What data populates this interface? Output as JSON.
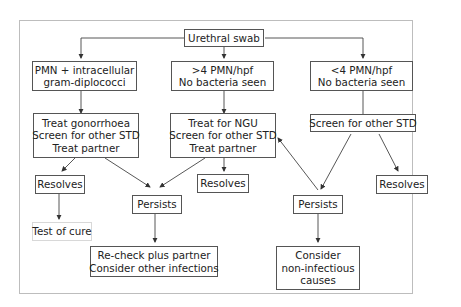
{
  "diagram": {
    "type": "flowchart",
    "nodes": {
      "root": {
        "lines": [
          "Urethral swab"
        ]
      },
      "left_finding": {
        "lines": [
          "PMN + intracellular",
          "gram-diplococci"
        ]
      },
      "mid_finding": {
        "lines": [
          ">4 PMN/hpf",
          "No bacteria seen"
        ]
      },
      "right_finding": {
        "lines": [
          "<4 PMN/hpf",
          "No bacteria seen"
        ]
      },
      "left_treat": {
        "lines": [
          "Treat gonorrhoea",
          "Screen for other STD",
          "Treat partner"
        ]
      },
      "mid_treat": {
        "lines": [
          "Treat for NGU",
          "Screen for other STD",
          "Treat partner"
        ]
      },
      "right_treat": {
        "lines": [
          "Screen for other STD"
        ]
      },
      "left_resolves": {
        "lines": [
          "Resolves"
        ]
      },
      "mid_resolves": {
        "lines": [
          "Resolves"
        ]
      },
      "right_resolves": {
        "lines": [
          "Resolves"
        ]
      },
      "left_persists": {
        "lines": [
          "Persists"
        ]
      },
      "right_persists": {
        "lines": [
          "Persists"
        ]
      },
      "test_of_cure": {
        "lines": [
          "Test of cure"
        ]
      },
      "recheck": {
        "lines": [
          "Re-check plus partner",
          "Consider other infections"
        ]
      },
      "non_infectious": {
        "lines": [
          "Consider",
          "non-infectious",
          "causes"
        ]
      }
    },
    "edges": [
      [
        "root",
        "left_finding"
      ],
      [
        "root",
        "mid_finding"
      ],
      [
        "root",
        "right_finding"
      ],
      [
        "left_finding",
        "left_treat"
      ],
      [
        "mid_finding",
        "mid_treat"
      ],
      [
        "right_finding",
        "right_treat"
      ],
      [
        "left_treat",
        "left_resolves"
      ],
      [
        "left_treat",
        "left_persists"
      ],
      [
        "mid_treat",
        "left_persists"
      ],
      [
        "mid_treat",
        "mid_resolves"
      ],
      [
        "right_treat",
        "right_persists"
      ],
      [
        "right_treat",
        "right_resolves"
      ],
      [
        "right_persists",
        "mid_treat"
      ],
      [
        "left_resolves",
        "test_of_cure"
      ],
      [
        "left_persists",
        "recheck"
      ],
      [
        "right_persists",
        "non_infectious"
      ]
    ]
  }
}
